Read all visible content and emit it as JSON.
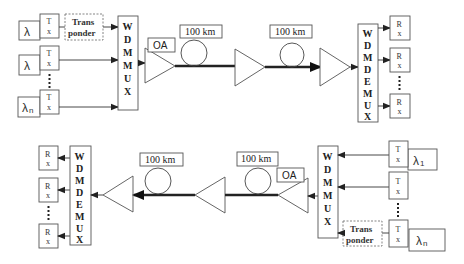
{
  "diagram": {
    "type": "WDM bidirectional optical link",
    "top_link": {
      "direction": "left-to-right",
      "sources": [
        {
          "lambda": "λ",
          "subscript": "",
          "tx_label_top": "T",
          "tx_label_bottom": "x",
          "via_transponder": true
        },
        {
          "lambda": "λ",
          "subscript": "",
          "tx_label_top": "T",
          "tx_label_bottom": "x",
          "via_transponder": false
        },
        {
          "lambda": "λ",
          "subscript": "n",
          "tx_label_top": "T",
          "tx_label_bottom": "x",
          "via_transponder": false
        }
      ],
      "transponder": {
        "line1": "Trans",
        "line2": "ponder"
      },
      "mux_letters": [
        "W",
        "D",
        "M",
        "M",
        "U",
        "X"
      ],
      "amplifier_label": "OA",
      "spans": [
        {
          "label": "100 km"
        },
        {
          "label": "100 km"
        }
      ],
      "demux_letters": [
        "W",
        "D",
        "M",
        "D",
        "E",
        "M",
        "U",
        "X"
      ],
      "receivers": [
        {
          "top": "R",
          "bottom": "x"
        },
        {
          "top": "R",
          "bottom": "x"
        },
        {
          "top": "R",
          "bottom": "x"
        }
      ]
    },
    "bottom_link": {
      "direction": "right-to-left",
      "sources": [
        {
          "lambda": "λ",
          "subscript": "1",
          "tx_label_top": "T",
          "tx_label_bottom": "x",
          "via_transponder": false
        },
        {
          "lambda": "",
          "subscript": "",
          "tx_label_top": "T",
          "tx_label_bottom": "x",
          "via_transponder": false
        },
        {
          "lambda": "λ",
          "subscript": "n",
          "tx_label_top": "T",
          "tx_label_bottom": "x",
          "via_transponder": true
        }
      ],
      "transponder": {
        "line1": "Trans",
        "line2": "ponder"
      },
      "mux_letters": [
        "W",
        "D",
        "M",
        "M",
        "U",
        "X"
      ],
      "amplifier_label": "OA",
      "spans": [
        {
          "label": "100 km"
        },
        {
          "label": "100 km"
        }
      ],
      "demux_letters": [
        "W",
        "D",
        "M",
        "D",
        "E",
        "M",
        "U",
        "X"
      ],
      "receivers": [
        {
          "top": "R",
          "bottom": "x"
        },
        {
          "top": "R",
          "bottom": "x"
        },
        {
          "top": "R",
          "bottom": "x"
        }
      ]
    }
  }
}
